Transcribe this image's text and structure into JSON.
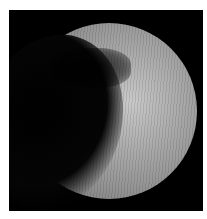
{
  "image": {
    "subject": "partially illuminated planetary body",
    "background_color": "#ffffff",
    "frame_color": "#000000"
  }
}
